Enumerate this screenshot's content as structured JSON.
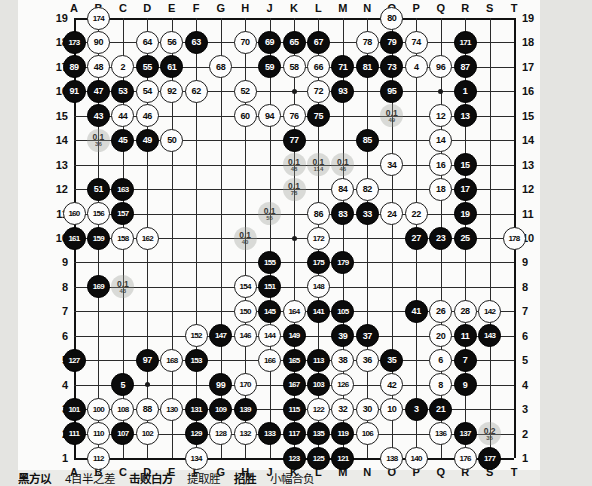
{
  "board": {
    "size": 19,
    "col_labels": [
      "A",
      "B",
      "C",
      "D",
      "E",
      "F",
      "G",
      "H",
      "J",
      "K",
      "L",
      "M",
      "N",
      "O",
      "P",
      "Q",
      "R",
      "S",
      "T"
    ],
    "row_labels": [
      "19",
      "18",
      "17",
      "16",
      "15",
      "14",
      "13",
      "12",
      "11",
      "10",
      "9",
      "8",
      "7",
      "6",
      "5",
      "4",
      "3",
      "2",
      "1"
    ],
    "hoshi": [
      [
        3,
        3
      ],
      [
        9,
        3
      ],
      [
        15,
        3
      ],
      [
        3,
        9
      ],
      [
        9,
        9
      ],
      [
        15,
        9
      ],
      [
        3,
        15
      ],
      [
        9,
        15
      ],
      [
        15,
        15
      ]
    ],
    "colors": {
      "black": "#0b0b0b",
      "white": "#fdfdfd",
      "line": "#2b2b2b",
      "ghost": "#969891"
    }
  },
  "stones": [
    {
      "c": 1,
      "r": 19,
      "color": "w",
      "label": "174"
    },
    {
      "c": 0,
      "r": 18,
      "color": "b",
      "label": "173"
    },
    {
      "c": 1,
      "r": 18,
      "color": "w",
      "label": "90"
    },
    {
      "c": 3,
      "r": 18,
      "color": "w",
      "label": "64"
    },
    {
      "c": 4,
      "r": 18,
      "color": "w",
      "label": "56"
    },
    {
      "c": 5,
      "r": 18,
      "color": "b",
      "label": "63"
    },
    {
      "c": 7,
      "r": 18,
      "color": "w",
      "label": "70"
    },
    {
      "c": 8,
      "r": 18,
      "color": "b",
      "label": "69"
    },
    {
      "c": 9,
      "r": 18,
      "color": "b",
      "label": "65"
    },
    {
      "c": 10,
      "r": 18,
      "color": "b",
      "label": "67"
    },
    {
      "c": 12,
      "r": 18,
      "color": "w",
      "label": "78"
    },
    {
      "c": 13,
      "r": 18,
      "color": "b",
      "label": "79"
    },
    {
      "c": 14,
      "r": 18,
      "color": "w",
      "label": "74"
    },
    {
      "c": 16,
      "r": 18,
      "color": "b",
      "label": "171"
    },
    {
      "c": 13,
      "r": 19,
      "color": "w",
      "label": "80"
    },
    {
      "c": 0,
      "r": 17,
      "color": "b",
      "label": "89"
    },
    {
      "c": 1,
      "r": 17,
      "color": "w",
      "label": "48"
    },
    {
      "c": 2,
      "r": 17,
      "color": "w",
      "label": "2"
    },
    {
      "c": 3,
      "r": 17,
      "color": "b",
      "label": "55"
    },
    {
      "c": 4,
      "r": 17,
      "color": "b",
      "label": "61"
    },
    {
      "c": 6,
      "r": 17,
      "color": "w",
      "label": "68"
    },
    {
      "c": 8,
      "r": 17,
      "color": "b",
      "label": "59"
    },
    {
      "c": 9,
      "r": 17,
      "color": "w",
      "label": "58"
    },
    {
      "c": 10,
      "r": 17,
      "color": "w",
      "label": "66"
    },
    {
      "c": 11,
      "r": 17,
      "color": "b",
      "label": "71"
    },
    {
      "c": 12,
      "r": 17,
      "color": "b",
      "label": "81"
    },
    {
      "c": 13,
      "r": 17,
      "color": "b",
      "label": "73"
    },
    {
      "c": 14,
      "r": 17,
      "color": "w",
      "label": "4"
    },
    {
      "c": 15,
      "r": 17,
      "color": "w",
      "label": "96"
    },
    {
      "c": 16,
      "r": 17,
      "color": "b",
      "label": "87"
    },
    {
      "c": 0,
      "r": 16,
      "color": "b",
      "label": "91"
    },
    {
      "c": 1,
      "r": 16,
      "color": "b",
      "label": "47"
    },
    {
      "c": 2,
      "r": 16,
      "color": "b",
      "label": "53"
    },
    {
      "c": 3,
      "r": 16,
      "color": "w",
      "label": "54"
    },
    {
      "c": 4,
      "r": 16,
      "color": "w",
      "label": "92"
    },
    {
      "c": 5,
      "r": 16,
      "color": "w",
      "label": "62"
    },
    {
      "c": 7,
      "r": 16,
      "color": "w",
      "label": "52"
    },
    {
      "c": 10,
      "r": 16,
      "color": "w",
      "label": "72"
    },
    {
      "c": 11,
      "r": 16,
      "color": "b",
      "label": "93"
    },
    {
      "c": 13,
      "r": 16,
      "color": "b",
      "label": "95"
    },
    {
      "c": 16,
      "r": 16,
      "color": "b",
      "label": "1"
    },
    {
      "c": 1,
      "r": 15,
      "color": "b",
      "label": "43"
    },
    {
      "c": 2,
      "r": 15,
      "color": "w",
      "label": "44"
    },
    {
      "c": 3,
      "r": 15,
      "color": "w",
      "label": "46"
    },
    {
      "c": 7,
      "r": 15,
      "color": "w",
      "label": "60"
    },
    {
      "c": 8,
      "r": 15,
      "color": "w",
      "label": "94"
    },
    {
      "c": 9,
      "r": 15,
      "color": "w",
      "label": "76"
    },
    {
      "c": 10,
      "r": 15,
      "color": "b",
      "label": "75"
    },
    {
      "c": 15,
      "r": 15,
      "color": "w",
      "label": "12"
    },
    {
      "c": 16,
      "r": 15,
      "color": "b",
      "label": "13"
    },
    {
      "c": 2,
      "r": 14,
      "color": "b",
      "label": "45"
    },
    {
      "c": 3,
      "r": 14,
      "color": "b",
      "label": "49"
    },
    {
      "c": 4,
      "r": 14,
      "color": "w",
      "label": "50"
    },
    {
      "c": 9,
      "r": 14,
      "color": "b",
      "label": "77"
    },
    {
      "c": 12,
      "r": 14,
      "color": "b",
      "label": "85"
    },
    {
      "c": 15,
      "r": 14,
      "color": "w",
      "label": "14"
    },
    {
      "c": 13,
      "r": 13,
      "color": "w",
      "label": "34"
    },
    {
      "c": 15,
      "r": 13,
      "color": "w",
      "label": "16"
    },
    {
      "c": 16,
      "r": 13,
      "color": "b",
      "label": "15"
    },
    {
      "c": 1,
      "r": 12,
      "color": "b",
      "label": "51"
    },
    {
      "c": 2,
      "r": 12,
      "color": "b",
      "label": "163"
    },
    {
      "c": 11,
      "r": 12,
      "color": "w",
      "label": "84"
    },
    {
      "c": 12,
      "r": 12,
      "color": "w",
      "label": "82"
    },
    {
      "c": 15,
      "r": 12,
      "color": "w",
      "label": "18"
    },
    {
      "c": 16,
      "r": 12,
      "color": "b",
      "label": "17"
    },
    {
      "c": 0,
      "r": 11,
      "color": "w",
      "label": "160"
    },
    {
      "c": 1,
      "r": 11,
      "color": "w",
      "label": "156"
    },
    {
      "c": 2,
      "r": 11,
      "color": "b",
      "label": "157"
    },
    {
      "c": 10,
      "r": 11,
      "color": "w",
      "label": "86"
    },
    {
      "c": 11,
      "r": 11,
      "color": "b",
      "label": "83"
    },
    {
      "c": 12,
      "r": 11,
      "color": "b",
      "label": "33"
    },
    {
      "c": 13,
      "r": 11,
      "color": "w",
      "label": "24"
    },
    {
      "c": 14,
      "r": 11,
      "color": "w",
      "label": "22"
    },
    {
      "c": 16,
      "r": 11,
      "color": "b",
      "label": "19"
    },
    {
      "c": 0,
      "r": 10,
      "color": "b",
      "label": "161"
    },
    {
      "c": 1,
      "r": 10,
      "color": "b",
      "label": "159"
    },
    {
      "c": 2,
      "r": 10,
      "color": "w",
      "label": "158"
    },
    {
      "c": 3,
      "r": 10,
      "color": "w",
      "label": "162"
    },
    {
      "c": 10,
      "r": 10,
      "color": "w",
      "label": "172"
    },
    {
      "c": 14,
      "r": 10,
      "color": "b",
      "label": "27"
    },
    {
      "c": 15,
      "r": 10,
      "color": "b",
      "label": "23"
    },
    {
      "c": 16,
      "r": 10,
      "color": "b",
      "label": "25"
    },
    {
      "c": 18,
      "r": 10,
      "color": "w",
      "label": "178"
    },
    {
      "c": 8,
      "r": 9,
      "color": "b",
      "label": "155"
    },
    {
      "c": 11,
      "r": 9,
      "color": "b",
      "label": "179"
    },
    {
      "c": 1,
      "r": 8,
      "color": "b",
      "label": "169"
    },
    {
      "c": 7,
      "r": 8,
      "color": "w",
      "label": "154"
    },
    {
      "c": 8,
      "r": 8,
      "color": "b",
      "label": "151"
    },
    {
      "c": 10,
      "r": 9,
      "color": "b",
      "label": "175"
    },
    {
      "c": 10,
      "r": 8,
      "color": "w",
      "label": "148"
    },
    {
      "c": 7,
      "r": 7,
      "color": "w",
      "label": "150"
    },
    {
      "c": 8,
      "r": 7,
      "color": "b",
      "label": "145"
    },
    {
      "c": 9,
      "r": 7,
      "color": "w",
      "label": "164"
    },
    {
      "c": 10,
      "r": 7,
      "color": "b",
      "label": "141"
    },
    {
      "c": 11,
      "r": 7,
      "color": "b",
      "label": "105"
    },
    {
      "c": 14,
      "r": 7,
      "color": "b",
      "label": "41"
    },
    {
      "c": 15,
      "r": 7,
      "color": "w",
      "label": "26"
    },
    {
      "c": 16,
      "r": 7,
      "color": "w",
      "label": "28"
    },
    {
      "c": 17,
      "r": 7,
      "color": "w",
      "label": "142"
    },
    {
      "c": 5,
      "r": 6,
      "color": "w",
      "label": "152"
    },
    {
      "c": 6,
      "r": 6,
      "color": "b",
      "label": "147"
    },
    {
      "c": 7,
      "r": 6,
      "color": "w",
      "label": "146"
    },
    {
      "c": 8,
      "r": 6,
      "color": "w",
      "label": "144"
    },
    {
      "c": 9,
      "r": 6,
      "color": "b",
      "label": "149"
    },
    {
      "c": 11,
      "r": 6,
      "color": "b",
      "label": "39"
    },
    {
      "c": 12,
      "r": 6,
      "color": "b",
      "label": "37"
    },
    {
      "c": 15,
      "r": 6,
      "color": "w",
      "label": "20"
    },
    {
      "c": 16,
      "r": 6,
      "color": "b",
      "label": "11"
    },
    {
      "c": 17,
      "r": 6,
      "color": "b",
      "label": "143"
    },
    {
      "c": 0,
      "r": 5,
      "color": "b",
      "label": "127"
    },
    {
      "c": 3,
      "r": 5,
      "color": "b",
      "label": "97"
    },
    {
      "c": 4,
      "r": 5,
      "color": "w",
      "label": "168"
    },
    {
      "c": 5,
      "r": 5,
      "color": "b",
      "label": "153"
    },
    {
      "c": 8,
      "r": 5,
      "color": "w",
      "label": "166"
    },
    {
      "c": 9,
      "r": 5,
      "color": "b",
      "label": "165"
    },
    {
      "c": 10,
      "r": 5,
      "color": "b",
      "label": "113"
    },
    {
      "c": 11,
      "r": 5,
      "color": "w",
      "label": "38"
    },
    {
      "c": 12,
      "r": 5,
      "color": "w",
      "label": "36"
    },
    {
      "c": 13,
      "r": 5,
      "color": "b",
      "label": "35"
    },
    {
      "c": 15,
      "r": 5,
      "color": "w",
      "label": "6"
    },
    {
      "c": 16,
      "r": 5,
      "color": "b",
      "label": "7"
    },
    {
      "c": 2,
      "r": 4,
      "color": "b",
      "label": "5"
    },
    {
      "c": 6,
      "r": 4,
      "color": "b",
      "label": "99"
    },
    {
      "c": 7,
      "r": 4,
      "color": "w",
      "label": "170"
    },
    {
      "c": 9,
      "r": 4,
      "color": "b",
      "label": "167"
    },
    {
      "c": 10,
      "r": 4,
      "color": "b",
      "label": "103"
    },
    {
      "c": 11,
      "r": 4,
      "color": "w",
      "label": "126"
    },
    {
      "c": 13,
      "r": 4,
      "color": "w",
      "label": "42"
    },
    {
      "c": 15,
      "r": 4,
      "color": "w",
      "label": "8"
    },
    {
      "c": 16,
      "r": 4,
      "color": "b",
      "label": "9"
    },
    {
      "c": 0,
      "r": 3,
      "color": "b",
      "label": "101"
    },
    {
      "c": 1,
      "r": 3,
      "color": "w",
      "label": "100"
    },
    {
      "c": 2,
      "r": 3,
      "color": "w",
      "label": "108"
    },
    {
      "c": 3,
      "r": 3,
      "color": "w",
      "label": "88"
    },
    {
      "c": 4,
      "r": 3,
      "color": "w",
      "label": "130"
    },
    {
      "c": 5,
      "r": 3,
      "color": "b",
      "label": "131"
    },
    {
      "c": 6,
      "r": 3,
      "color": "b",
      "label": "109"
    },
    {
      "c": 7,
      "r": 3,
      "color": "b",
      "label": "139"
    },
    {
      "c": 9,
      "r": 3,
      "color": "b",
      "label": "115"
    },
    {
      "c": 10,
      "r": 3,
      "color": "w",
      "label": "122"
    },
    {
      "c": 11,
      "r": 3,
      "color": "w",
      "label": "32"
    },
    {
      "c": 12,
      "r": 3,
      "color": "w",
      "label": "30"
    },
    {
      "c": 13,
      "r": 3,
      "color": "w",
      "label": "10"
    },
    {
      "c": 14,
      "r": 3,
      "color": "b",
      "label": "3"
    },
    {
      "c": 15,
      "r": 3,
      "color": "b",
      "label": "21"
    },
    {
      "c": 0,
      "r": 2,
      "color": "b",
      "label": "111"
    },
    {
      "c": 1,
      "r": 2,
      "color": "w",
      "label": "110"
    },
    {
      "c": 2,
      "r": 2,
      "color": "b",
      "label": "107"
    },
    {
      "c": 3,
      "r": 2,
      "color": "w",
      "label": "102"
    },
    {
      "c": 5,
      "r": 2,
      "color": "b",
      "label": "129"
    },
    {
      "c": 6,
      "r": 2,
      "color": "w",
      "label": "128"
    },
    {
      "c": 7,
      "r": 2,
      "color": "w",
      "label": "132"
    },
    {
      "c": 8,
      "r": 2,
      "color": "b",
      "label": "133"
    },
    {
      "c": 9,
      "r": 2,
      "color": "b",
      "label": "117"
    },
    {
      "c": 10,
      "r": 2,
      "color": "b",
      "label": "135"
    },
    {
      "c": 11,
      "r": 2,
      "color": "b",
      "label": "119"
    },
    {
      "c": 12,
      "r": 2,
      "color": "w",
      "label": "106"
    },
    {
      "c": 15,
      "r": 2,
      "color": "w",
      "label": "136"
    },
    {
      "c": 16,
      "r": 2,
      "color": "b",
      "label": "137"
    },
    {
      "c": 1,
      "r": 1,
      "color": "w",
      "label": "112"
    },
    {
      "c": 5,
      "r": 1,
      "color": "w",
      "label": "134"
    },
    {
      "c": 9,
      "r": 1,
      "color": "b",
      "label": "123"
    },
    {
      "c": 10,
      "r": 1,
      "color": "b",
      "label": "125"
    },
    {
      "c": 11,
      "r": 1,
      "color": "b",
      "label": "121"
    },
    {
      "c": 13,
      "r": 1,
      "color": "w",
      "label": "138"
    },
    {
      "c": 14,
      "r": 1,
      "color": "w",
      "label": "140"
    },
    {
      "c": 16,
      "r": 1,
      "color": "w",
      "label": "176"
    },
    {
      "c": 17,
      "r": 1,
      "color": "b",
      "label": "177"
    }
  ],
  "ghosts": [
    {
      "c": 1,
      "r": 14,
      "value": "0.1",
      "sub": "36"
    },
    {
      "c": 13,
      "r": 15,
      "value": "0.1",
      "sub": "49"
    },
    {
      "c": 9,
      "r": 13,
      "value": "0.1",
      "sub": "48"
    },
    {
      "c": 10,
      "r": 13,
      "value": "0.1",
      "sub": "114"
    },
    {
      "c": 11,
      "r": 13,
      "value": "0.1",
      "sub": "46"
    },
    {
      "c": 9,
      "r": 12,
      "value": "0.1",
      "sub": "78"
    },
    {
      "c": 8,
      "r": 11,
      "value": "0.1",
      "sub": "55"
    },
    {
      "c": 7,
      "r": 10,
      "value": "0.1",
      "sub": "40"
    },
    {
      "c": 2,
      "r": 8,
      "value": "0.1",
      "sub": "43"
    },
    {
      "c": 17,
      "r": 2,
      "value": "0.2",
      "sub": "35"
    }
  ],
  "caption": {
    "parts": [
      "黑方以",
      "4目半之差",
      "击败白方",
      "提取胜",
      "招胜",
      "小幅合负"
    ]
  }
}
